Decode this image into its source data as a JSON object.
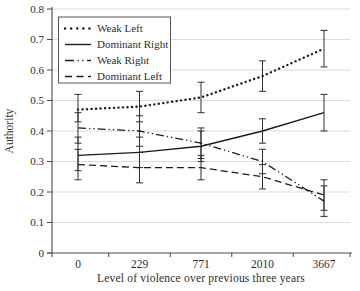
{
  "figure": {
    "background": "#ffffff"
  },
  "chart_data": {
    "type": "line",
    "title": "",
    "xlabel": "Level of violence over previous three years",
    "ylabel": "Authority",
    "categories": [
      "0",
      "229",
      "771",
      "2010",
      "3667"
    ],
    "ylim": [
      0,
      0.8
    ],
    "y_ticks": [
      0,
      0.1,
      0.2,
      0.3,
      0.4,
      0.5,
      0.6,
      0.7,
      0.8
    ],
    "grid": "horizontal",
    "legend_position": "top-left",
    "error_bars": true,
    "colors": {
      "line": "#1c1c1c",
      "axis": "#4a4a4a",
      "grid": "#dcdcdc",
      "error": "#2f2f2f",
      "text": "#2e2e2e",
      "legend_border": "#555555"
    },
    "series": [
      {
        "name": "Weak Left",
        "line_style": "dotted",
        "values": [
          0.47,
          0.48,
          0.51,
          0.58,
          0.67
        ],
        "ci_low": [
          0.43,
          0.43,
          0.46,
          0.53,
          0.61
        ],
        "ci_high": [
          0.52,
          0.53,
          0.56,
          0.63,
          0.73
        ]
      },
      {
        "name": "Dominant Right",
        "line_style": "solid",
        "values": [
          0.32,
          0.33,
          0.35,
          0.4,
          0.46
        ],
        "ci_low": [
          0.27,
          0.28,
          0.3,
          0.36,
          0.4
        ],
        "ci_high": [
          0.38,
          0.38,
          0.4,
          0.44,
          0.52
        ]
      },
      {
        "name": "Weak Right",
        "line_style": "dash-dot",
        "values": [
          0.41,
          0.4,
          0.36,
          0.3,
          0.17
        ],
        "ci_low": [
          0.36,
          0.35,
          0.31,
          0.26,
          0.12
        ],
        "ci_high": [
          0.46,
          0.45,
          0.41,
          0.34,
          0.22
        ]
      },
      {
        "name": "Dominant Left",
        "line_style": "dashed",
        "values": [
          0.29,
          0.28,
          0.28,
          0.25,
          0.19
        ],
        "ci_low": [
          0.24,
          0.23,
          0.24,
          0.21,
          0.14
        ],
        "ci_high": [
          0.34,
          0.33,
          0.32,
          0.29,
          0.24
        ]
      }
    ]
  }
}
